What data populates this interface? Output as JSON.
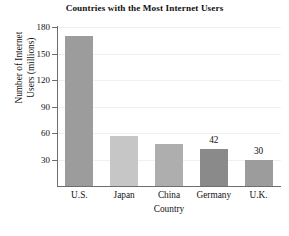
{
  "chart_data": {
    "type": "bar",
    "title": "Countries with the Most Internet Users",
    "xlabel": "Country",
    "ylabel_line1": "Number of Internet",
    "ylabel_line2": "Users (millions)",
    "ylabel": "Number of Internet Users (millions)",
    "categories": [
      "U.S.",
      "Japan",
      "China",
      "Germany",
      "U.K."
    ],
    "values": [
      170,
      57,
      47,
      42,
      30
    ],
    "point_labels": [
      "",
      "",
      "",
      "42",
      "30"
    ],
    "yticks": [
      30,
      60,
      90,
      120,
      150,
      180
    ],
    "ylim": [
      0,
      180
    ],
    "grid": true,
    "legend": "none",
    "bar_colors": [
      "#9c9c9c",
      "#c6c6c6",
      "#aeaeae",
      "#8a8a8a",
      "#9c9c9c"
    ],
    "axis_color": "#6e6e6e",
    "grid_color": "#f0f0f0",
    "background": "#ffffff"
  }
}
